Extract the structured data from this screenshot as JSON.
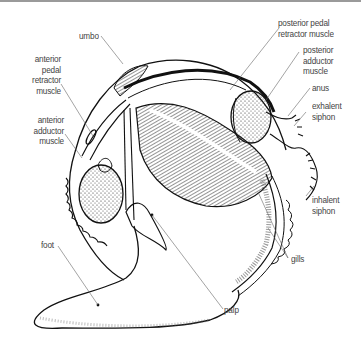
{
  "diagram": {
    "labels": {
      "umbo": "umbo",
      "anterior_pedal_retractor_muscle": "anterior\npedal\nretractor\nmuscle",
      "anterior_adductor_muscle": "anterior\nadductor\nmuscle",
      "foot": "foot",
      "posterior_pedal_retractor_muscle": "posterior pedal\nretractor muscle",
      "posterior_adductor_muscle": "posterior\nadductor\nmuscle",
      "anus": "anus",
      "exhalent_siphon": "exhalent\nsiphon",
      "inhalent_siphon": "inhalent\nsiphon",
      "gills": "gills",
      "palp": "palp"
    },
    "colors": {
      "ink": "#111111",
      "leader": "#666666",
      "label": "#444444",
      "background": "#ffffff"
    }
  }
}
